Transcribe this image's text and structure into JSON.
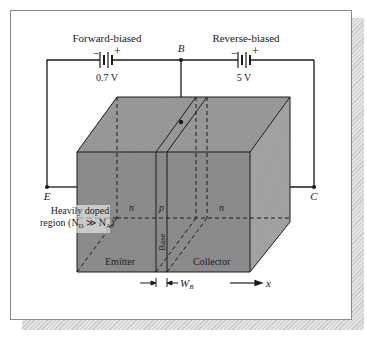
{
  "diagram": {
    "batteries": [
      {
        "label": "Forward-biased",
        "voltage": "0.7 V",
        "minus": "−",
        "plus": "+"
      },
      {
        "label": "Reverse-biased",
        "voltage": "5 V",
        "minus": "−",
        "plus": "+"
      }
    ],
    "terminals": {
      "base": "B",
      "emitter": "E",
      "collector": "C"
    },
    "regions": {
      "emitter_type": "n",
      "base_type": "p",
      "collector_type": "n",
      "emitter_label": "Emitter",
      "base_label": "Base",
      "collector_label": "Collector"
    },
    "annotations": {
      "heavily_doped_line1": "Heavily doped",
      "heavily_doped_line2_prefix": "region (N",
      "nd_sub": "D",
      "gg": " ≫ N",
      "na_sub": "A",
      "close": ")",
      "base_width": "W",
      "base_width_sub": "B",
      "x_axis": "x"
    },
    "colors": {
      "block_fill": "#8c8c8c",
      "block_top": "#9a9a9a",
      "block_side": "#a3a3a3",
      "line": "#1a1a1a"
    }
  }
}
